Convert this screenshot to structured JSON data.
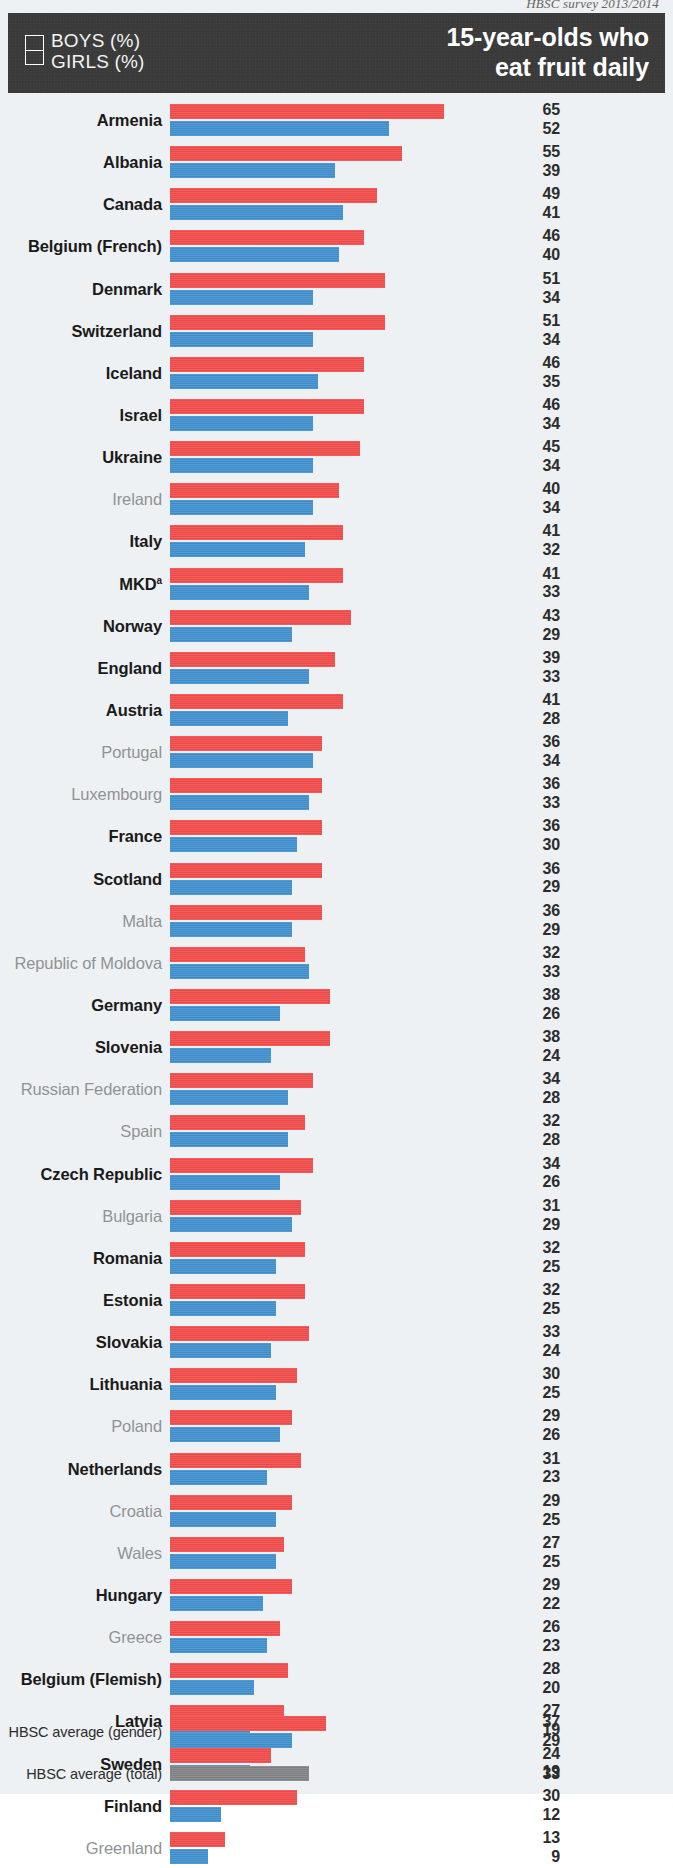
{
  "source_note": "HBSC survey 2013/2014",
  "header": {
    "title_line1": "15-year-olds who",
    "title_line2": "eat fruit daily",
    "legend": {
      "boys_label": "BOYS (%)",
      "girls_label": "GIRLS (%)",
      "boys_color": "#3f8fcd",
      "girls_color": "#f04b49"
    }
  },
  "chart_data": {
    "type": "bar",
    "orientation": "horizontal",
    "title": "15-year-olds who eat fruit daily",
    "subtitle": "HBSC survey 2013/2014",
    "xlabel": "",
    "ylabel": "",
    "xlim": [
      0,
      70
    ],
    "grid": false,
    "legend_position": "top-left",
    "value_unit": "%",
    "series": [
      {
        "name": "GIRLS (%)",
        "color": "#f04b49",
        "values": [
          65,
          55,
          49,
          46,
          51,
          51,
          46,
          46,
          45,
          40,
          41,
          41,
          43,
          39,
          41,
          36,
          36,
          36,
          36,
          36,
          32,
          38,
          38,
          34,
          32,
          34,
          31,
          32,
          32,
          33,
          30,
          29,
          31,
          29,
          27,
          29,
          26,
          28,
          27,
          24,
          30,
          13
        ]
      },
      {
        "name": "BOYS (%)",
        "color": "#3f8fcd",
        "values": [
          52,
          39,
          41,
          40,
          34,
          34,
          35,
          34,
          34,
          34,
          32,
          33,
          29,
          33,
          28,
          34,
          33,
          30,
          29,
          29,
          33,
          26,
          24,
          28,
          28,
          26,
          29,
          25,
          25,
          24,
          25,
          26,
          23,
          25,
          25,
          22,
          23,
          20,
          19,
          19,
          12,
          9
        ]
      }
    ],
    "categories": [
      "Armenia",
      "Albania",
      "Canada",
      "Belgium (French)",
      "Denmark",
      "Switzerland",
      "Iceland",
      "Israel",
      "Ukraine",
      "Ireland",
      "Italy",
      "MKD",
      "Norway",
      "England",
      "Austria",
      "Portugal",
      "Luxembourg",
      "France",
      "Scotland",
      "Malta",
      "Republic of Moldova",
      "Germany",
      "Slovenia",
      "Russian Federation",
      "Spain",
      "Czech Republic",
      "Bulgaria",
      "Romania",
      "Estonia",
      "Slovakia",
      "Lithuania",
      "Poland",
      "Netherlands",
      "Croatia",
      "Wales",
      "Hungary",
      "Greece",
      "Belgium (Flemish)",
      "Latvia",
      "Sweden",
      "Finland",
      "Greenland"
    ],
    "averages": {
      "gender_label": "HBSC average (gender)",
      "gender_girls": 37,
      "gender_boys": 29,
      "total_label": "HBSC average (total)",
      "total_value": 33,
      "total_color": "#808285"
    }
  },
  "rows": [
    {
      "country": "Armenia",
      "girls": 65,
      "boys": 52,
      "highlight": true,
      "footnote": ""
    },
    {
      "country": "Albania",
      "girls": 55,
      "boys": 39,
      "highlight": true,
      "footnote": ""
    },
    {
      "country": "Canada",
      "girls": 49,
      "boys": 41,
      "highlight": true,
      "footnote": ""
    },
    {
      "country": "Belgium (French)",
      "girls": 46,
      "boys": 40,
      "highlight": true,
      "footnote": ""
    },
    {
      "country": "Denmark",
      "girls": 51,
      "boys": 34,
      "highlight": true,
      "footnote": ""
    },
    {
      "country": "Switzerland",
      "girls": 51,
      "boys": 34,
      "highlight": true,
      "footnote": ""
    },
    {
      "country": "Iceland",
      "girls": 46,
      "boys": 35,
      "highlight": true,
      "footnote": ""
    },
    {
      "country": "Israel",
      "girls": 46,
      "boys": 34,
      "highlight": true,
      "footnote": ""
    },
    {
      "country": "Ukraine",
      "girls": 45,
      "boys": 34,
      "highlight": true,
      "footnote": ""
    },
    {
      "country": "Ireland",
      "girls": 40,
      "boys": 34,
      "highlight": false,
      "footnote": ""
    },
    {
      "country": "Italy",
      "girls": 41,
      "boys": 32,
      "highlight": true,
      "footnote": ""
    },
    {
      "country": "MKD",
      "girls": 41,
      "boys": 33,
      "highlight": true,
      "footnote": "a"
    },
    {
      "country": "Norway",
      "girls": 43,
      "boys": 29,
      "highlight": true,
      "footnote": ""
    },
    {
      "country": "England",
      "girls": 39,
      "boys": 33,
      "highlight": true,
      "footnote": ""
    },
    {
      "country": "Austria",
      "girls": 41,
      "boys": 28,
      "highlight": true,
      "footnote": ""
    },
    {
      "country": "Portugal",
      "girls": 36,
      "boys": 34,
      "highlight": false,
      "footnote": ""
    },
    {
      "country": "Luxembourg",
      "girls": 36,
      "boys": 33,
      "highlight": false,
      "footnote": ""
    },
    {
      "country": "France",
      "girls": 36,
      "boys": 30,
      "highlight": true,
      "footnote": ""
    },
    {
      "country": "Scotland",
      "girls": 36,
      "boys": 29,
      "highlight": true,
      "footnote": ""
    },
    {
      "country": "Malta",
      "girls": 36,
      "boys": 29,
      "highlight": false,
      "footnote": ""
    },
    {
      "country": "Republic of Moldova",
      "girls": 32,
      "boys": 33,
      "highlight": false,
      "footnote": ""
    },
    {
      "country": "Germany",
      "girls": 38,
      "boys": 26,
      "highlight": true,
      "footnote": ""
    },
    {
      "country": "Slovenia",
      "girls": 38,
      "boys": 24,
      "highlight": true,
      "footnote": ""
    },
    {
      "country": "Russian Federation",
      "girls": 34,
      "boys": 28,
      "highlight": false,
      "footnote": ""
    },
    {
      "country": "Spain",
      "girls": 32,
      "boys": 28,
      "highlight": false,
      "footnote": ""
    },
    {
      "country": "Czech Republic",
      "girls": 34,
      "boys": 26,
      "highlight": true,
      "footnote": ""
    },
    {
      "country": "Bulgaria",
      "girls": 31,
      "boys": 29,
      "highlight": false,
      "footnote": ""
    },
    {
      "country": "Romania",
      "girls": 32,
      "boys": 25,
      "highlight": true,
      "footnote": ""
    },
    {
      "country": "Estonia",
      "girls": 32,
      "boys": 25,
      "highlight": true,
      "footnote": ""
    },
    {
      "country": "Slovakia",
      "girls": 33,
      "boys": 24,
      "highlight": true,
      "footnote": ""
    },
    {
      "country": "Lithuania",
      "girls": 30,
      "boys": 25,
      "highlight": true,
      "footnote": ""
    },
    {
      "country": "Poland",
      "girls": 29,
      "boys": 26,
      "highlight": false,
      "footnote": ""
    },
    {
      "country": "Netherlands",
      "girls": 31,
      "boys": 23,
      "highlight": true,
      "footnote": ""
    },
    {
      "country": "Croatia",
      "girls": 29,
      "boys": 25,
      "highlight": false,
      "footnote": ""
    },
    {
      "country": "Wales",
      "girls": 27,
      "boys": 25,
      "highlight": false,
      "footnote": ""
    },
    {
      "country": "Hungary",
      "girls": 29,
      "boys": 22,
      "highlight": true,
      "footnote": ""
    },
    {
      "country": "Greece",
      "girls": 26,
      "boys": 23,
      "highlight": false,
      "footnote": ""
    },
    {
      "country": "Belgium (Flemish)",
      "girls": 28,
      "boys": 20,
      "highlight": true,
      "footnote": ""
    },
    {
      "country": "Latvia",
      "girls": 27,
      "boys": 19,
      "highlight": true,
      "footnote": ""
    },
    {
      "country": "Sweden",
      "girls": 24,
      "boys": 19,
      "highlight": true,
      "footnote": ""
    },
    {
      "country": "Finland",
      "girls": 30,
      "boys": 12,
      "highlight": true,
      "footnote": ""
    },
    {
      "country": "Greenland",
      "girls": 13,
      "boys": 9,
      "highlight": false,
      "footnote": ""
    }
  ]
}
